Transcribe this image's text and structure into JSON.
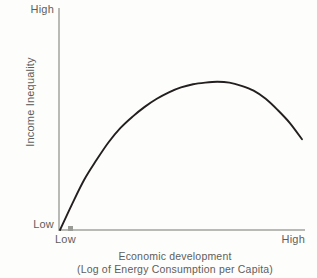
{
  "chart_data": {
    "type": "line",
    "title": "",
    "subtitle": "",
    "xlabel": "Economic development",
    "xlabel_sub": "(Log of Energy Consumption per Capita)",
    "ylabel": "Income Inequality",
    "x_tick_labels": [
      "Low",
      "High"
    ],
    "y_tick_labels": [
      "Low",
      "High"
    ],
    "xlim": [
      "Low",
      "High"
    ],
    "ylim": [
      "Low",
      "High"
    ],
    "grid": false,
    "legend": false,
    "annotations": [
      "origin-marker"
    ],
    "series": [
      {
        "name": "Kuznets curve",
        "color": "#231f20",
        "x": [
          0.0,
          0.05,
          0.1,
          0.15,
          0.2,
          0.25,
          0.3,
          0.35,
          0.4,
          0.45,
          0.5,
          0.55,
          0.6,
          0.65,
          0.7,
          0.75,
          0.8,
          0.85,
          0.9,
          0.95,
          1.0
        ],
        "y": [
          0.0,
          0.16,
          0.31,
          0.43,
          0.54,
          0.63,
          0.7,
          0.76,
          0.81,
          0.85,
          0.88,
          0.9,
          0.91,
          0.915,
          0.91,
          0.89,
          0.86,
          0.81,
          0.74,
          0.66,
          0.56
        ]
      }
    ]
  },
  "axes": {
    "y_high_label": "High",
    "y_low_label": "Low",
    "x_low_label": "Low",
    "x_high_label": "High",
    "y_title": "Income Inequality",
    "x_title_line1": "Economic development",
    "x_title_line2": "(Log of Energy Consumption per Capita)",
    "axis_color": "#b9b9b5",
    "curve_color": "#231f20",
    "text_color": "#5d5d5b",
    "background_color": "#fdfdfb"
  }
}
